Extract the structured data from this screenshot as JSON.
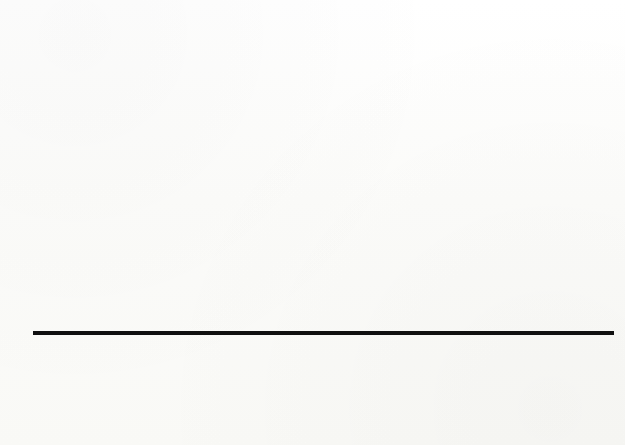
{
  "chart_data": {
    "type": "bar",
    "xlabel": "",
    "ylabel": "Dollars",
    "ylim": [
      0,
      35
    ],
    "ytick_step": 5,
    "yticks": [
      35,
      30,
      25,
      20,
      15,
      10,
      5,
      0
    ],
    "grid": "horizontal-dotted",
    "legend": "none",
    "stacked": true,
    "categories": [
      "Portugal*",
      "Greece",
      "Spain*",
      "Britain",
      "Ireland",
      "Canada",
      "United States",
      "Italy",
      "France",
      "Japan",
      "Netherlands",
      "Finland",
      "Sweden",
      "Austria",
      "Denmark",
      "Norway",
      "Belgium",
      "Switzerland",
      "Germany†"
    ],
    "series": [
      {
        "name": "base-cost",
        "color": "#0e0e0e",
        "values": [
          4.5,
          4.6,
          11.7,
          9.2,
          9.3,
          10.7,
          11.2,
          7.6,
          8.9,
          10.7,
          12.3,
          12.2,
          12.6,
          10.2,
          18.2,
          14.9,
          11.6,
          16.6,
          16.0
        ]
      },
      {
        "name": "additional-cost",
        "color": "#5b5b5b",
        "values": [
          0.0,
          3.8,
          0.0,
          3.8,
          3.7,
          4.5,
          5.2,
          9.3,
          9.4,
          9.1,
          9.6,
          10.2,
          9.9,
          13.1,
          5.5,
          8.9,
          13.1,
          10.4,
          14.3
        ]
      }
    ],
    "totals": [
      4.5,
      8.4,
      11.7,
      13.0,
      13.0,
      15.2,
      16.4,
      16.9,
      18.3,
      19.8,
      21.9,
      22.4,
      22.5,
      23.3,
      23.7,
      23.8,
      24.7,
      27.0,
      30.3
    ]
  },
  "colors": {
    "base_segment": "#0e0e0e",
    "top_segment": "#5b5b5b",
    "axis": "#101010",
    "grid_dot": "#3a3a3a",
    "page_background": "#fdfdfb"
  }
}
